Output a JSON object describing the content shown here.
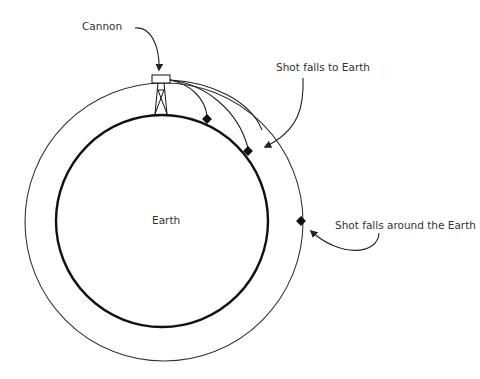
{
  "diagram": {
    "labels": {
      "cannon": "Cannon",
      "shot_falls_to_earth": "Shot falls to Earth",
      "shot_falls_around": "Shot falls around the Earth",
      "earth": "Earth"
    },
    "elements": {
      "earth_circle": "Earth surface",
      "orbit_circle": "Orbital path",
      "cannon": "Cannon on tower",
      "trajectories": [
        "short trajectory",
        "longer trajectory",
        "orbital trajectory"
      ],
      "impact_markers": [
        "impact 1",
        "impact 2",
        "orbit point"
      ]
    },
    "colors": {
      "line": "#000000",
      "text": "#333333",
      "background": "#ffffff"
    }
  }
}
